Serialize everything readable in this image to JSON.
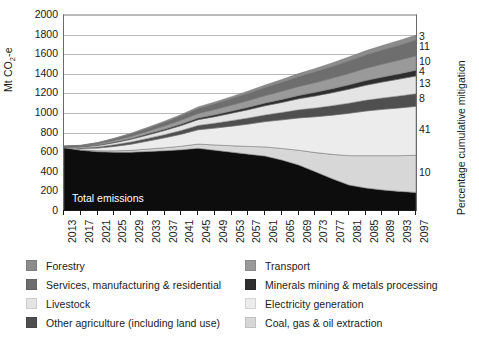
{
  "chart_data": {
    "type": "area",
    "stacking": "stacked",
    "title": "",
    "xlabel": "",
    "ylabel": "Mt CO2-e",
    "ylabel_rich": "Mt CO₂-e",
    "ylabel_right": "Percentage cumulative mitigation",
    "ylim": [
      0,
      2000
    ],
    "ytick_step": 200,
    "yticks": [
      0,
      200,
      400,
      600,
      800,
      1000,
      1200,
      1400,
      1600,
      1800,
      2000
    ],
    "grid": true,
    "legend_position": "below",
    "x": [
      2013,
      2017,
      2021,
      2025,
      2029,
      2033,
      2037,
      2041,
      2045,
      2049,
      2053,
      2057,
      2061,
      2065,
      2069,
      2073,
      2077,
      2081,
      2085,
      2089,
      2093,
      2097
    ],
    "xtick_labels": [
      "2013",
      "2017",
      "2021",
      "2025",
      "2029",
      "2033",
      "2037",
      "2041",
      "2045",
      "2049",
      "2053",
      "2057",
      "2061",
      "2065",
      "2069",
      "2073",
      "2077",
      "2081",
      "2085",
      "2089",
      "2093",
      "2097"
    ],
    "annotations": [
      {
        "text": "Total emissions",
        "x": 2017,
        "y": 260,
        "color": "#ffffff"
      }
    ],
    "right_axis_labels": [
      {
        "label": "3",
        "series": "Forestry"
      },
      {
        "label": "11",
        "series": "Services, manufacturing & residential"
      },
      {
        "label": "10",
        "series": "Transport"
      },
      {
        "label": "4",
        "series": "Minerals mining & metals processing"
      },
      {
        "label": "13",
        "series": "Livestock"
      },
      {
        "label": "8",
        "series": "Other agriculture (including land use)"
      },
      {
        "label": "41",
        "series": "Electricity generation"
      },
      {
        "label": "10",
        "series": "Coal, gas & oil extraction"
      }
    ],
    "series": [
      {
        "name": "Total emissions",
        "color": "#0d0d0d",
        "values": [
          645,
          620,
          605,
          600,
          600,
          608,
          615,
          625,
          640,
          620,
          600,
          580,
          560,
          520,
          470,
          400,
          330,
          265,
          235,
          215,
          200,
          190
        ]
      },
      {
        "name": "Coal, gas & oil extraction",
        "color": "#d7d7d7",
        "values": [
          2,
          5,
          9,
          14,
          19,
          24,
          30,
          36,
          43,
          54,
          66,
          79,
          94,
          118,
          150,
          196,
          248,
          300,
          330,
          350,
          365,
          378
        ]
      },
      {
        "name": "Electricity generation",
        "color": "#ececec",
        "values": [
          4,
          14,
          28,
          45,
          63,
          82,
          102,
          123,
          146,
          172,
          200,
          228,
          258,
          292,
          330,
          366,
          400,
          432,
          455,
          472,
          487,
          500
        ]
      },
      {
        "name": "Other agriculture (including land use)",
        "color": "#4f4f4f",
        "values": [
          3,
          7,
          12,
          17,
          22,
          27,
          32,
          38,
          44,
          50,
          56,
          62,
          68,
          75,
          82,
          89,
          96,
          103,
          110,
          116,
          122,
          128
        ]
      },
      {
        "name": "Livestock",
        "color": "#e4e4e4",
        "values": [
          3,
          8,
          14,
          21,
          28,
          35,
          43,
          51,
          59,
          67,
          76,
          85,
          94,
          103,
          113,
          123,
          133,
          143,
          153,
          163,
          172,
          182
        ]
      },
      {
        "name": "Minerals mining & metals processing",
        "color": "#2e2e2e",
        "values": [
          1,
          3,
          5,
          7,
          9,
          11,
          13,
          15,
          17,
          19,
          22,
          25,
          28,
          31,
          34,
          37,
          41,
          44,
          48,
          51,
          54,
          58
        ]
      },
      {
        "name": "Transport",
        "color": "#9a9a9a",
        "values": [
          2,
          6,
          11,
          16,
          22,
          28,
          34,
          40,
          47,
          54,
          61,
          68,
          76,
          84,
          92,
          100,
          108,
          117,
          125,
          133,
          140,
          148
        ]
      },
      {
        "name": "Services, manufacturing & residential",
        "color": "#6e6e6e",
        "values": [
          2,
          6,
          11,
          17,
          23,
          29,
          36,
          43,
          50,
          58,
          66,
          74,
          82,
          91,
          100,
          109,
          118,
          127,
          136,
          144,
          152,
          160
        ]
      },
      {
        "name": "Forestry",
        "color": "#8c8c8c",
        "values": [
          1,
          2,
          4,
          6,
          8,
          10,
          12,
          14,
          16,
          18,
          20,
          23,
          25,
          28,
          31,
          34,
          37,
          40,
          43,
          45,
          48,
          50
        ]
      }
    ]
  },
  "legend": {
    "left_column": [
      {
        "label": "Forestry",
        "color": "#8c8c8c"
      },
      {
        "label": "Services, manufacturing & residential",
        "color": "#6e6e6e"
      },
      {
        "label": "Livestock",
        "color": "#e4e4e4"
      },
      {
        "label": "Other agriculture (including land use)",
        "color": "#4f4f4f"
      }
    ],
    "right_column": [
      {
        "label": "Transport",
        "color": "#9a9a9a"
      },
      {
        "label": "Minerals mining & metals processing",
        "color": "#2e2e2e"
      },
      {
        "label": "Electricity generation",
        "color": "#ececec"
      },
      {
        "label": "Coal, gas & oil extraction",
        "color": "#d7d7d7"
      }
    ]
  }
}
